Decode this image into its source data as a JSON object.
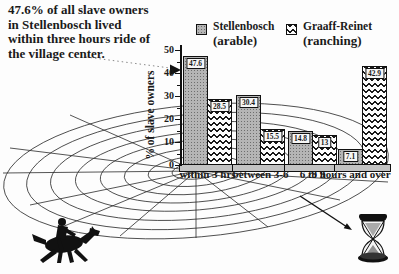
{
  "annotation": {
    "text": "47.6% of all slave owners\nin Stellenbosch lived\nwithin three hours ride of\nthe village center."
  },
  "legend": [
    {
      "label": "Stellenbosch",
      "sublabel": "(arable)",
      "swatch": "gray-dotted-square"
    },
    {
      "label": "Graaff-Reinet",
      "sublabel": "(ranching)",
      "swatch": "black-zigzag-square"
    }
  ],
  "chart_data": {
    "type": "bar",
    "categories": [
      "within 3 hrs",
      "between 3-6",
      "6 to 9",
      "9 hours and over"
    ],
    "series": [
      {
        "name": "Stellenbosch (arable)",
        "pattern": "gray-dotted",
        "values": [
          47.6,
          30.4,
          14.8,
          7.1
        ]
      },
      {
        "name": "Graaff-Reinet (ranching)",
        "pattern": "black-zigzag",
        "values": [
          28.5,
          15.5,
          13,
          42.9
        ]
      }
    ],
    "title": "",
    "xlabel": "",
    "ylabel": "% of slave owners",
    "ylim": [
      0,
      50
    ],
    "y_ticks": [
      0,
      10,
      20,
      30,
      40,
      50
    ],
    "bar_value_labels": [
      "47.6",
      "28.5",
      "30.4",
      "15.5",
      "14.8",
      "13",
      "7.1",
      "42.9"
    ],
    "legend_position": "top-right",
    "grid": "perspective spider-web of concentric distance rings around village center"
  },
  "icons": {
    "horse_rider": "galloping horse with rider silhouette",
    "hourglass": "hourglass",
    "leader_arrow": "dotted leader line with solid arrowhead",
    "hourglass_arrow": "solid arrow pointing to hourglass"
  },
  "colors": {
    "background": "#fdfdfd",
    "ink": "#1a1a1a",
    "stellenbosch_bar": "#b5b5b5",
    "graaff_reinet_pattern": "#1a1a1a",
    "pedestal": "#c3c3c3"
  }
}
